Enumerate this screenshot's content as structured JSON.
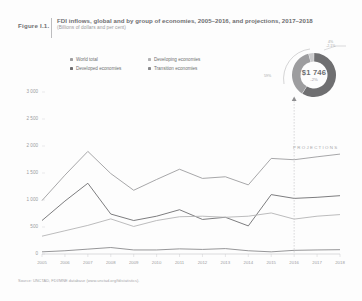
{
  "figure": {
    "label": "Figure I.1.",
    "title": "FDI inflows, global and by group of economies, 2005–2016, and projections, 2017–2018",
    "subtitle": "(Billions of dollars and per cent)"
  },
  "legend": {
    "items": [
      {
        "label": "World total",
        "color": "#9d9d9f"
      },
      {
        "label": "Developed economies",
        "color": "#6e6e70"
      },
      {
        "label": "Developing economies",
        "color": "#b4b4b6"
      },
      {
        "label": "Transition economies",
        "color": "#8a8a8c"
      }
    ]
  },
  "donut": {
    "center_value": "$1 746",
    "center_change": "-2%",
    "left_label": "59%",
    "top_label_line1": "4%",
    "top_label_line2": "-2.1%",
    "segments": [
      {
        "name": "developing",
        "percent": 59,
        "color": "#6f6f71"
      },
      {
        "name": "developed",
        "percent": 37,
        "color": "#9d9d9f"
      },
      {
        "name": "transition",
        "percent": 4,
        "color": "#c9c9cb"
      }
    ]
  },
  "projections": {
    "label": "PROJECTIONS",
    "divider_year": "2016"
  },
  "source": {
    "text": "Source: UNCTAD, FDI/MNE database (www.unctad.org/fdistatistics)."
  },
  "chart_data": {
    "type": "line",
    "title": "FDI inflows, global and by group of economies, 2005–2016, and projections, 2017–2018",
    "xlabel": "",
    "ylabel": "Billions of dollars",
    "ylim": [
      0,
      3000
    ],
    "yticks": [
      "0",
      "500",
      "1 000",
      "1 500",
      "2 000",
      "2 500",
      "3 000"
    ],
    "ytick_values": [
      0,
      500,
      1000,
      1500,
      2000,
      2500,
      3000
    ],
    "grid": false,
    "legend_position": "top",
    "categories": [
      "2005",
      "2006",
      "2007",
      "2008",
      "2009",
      "2010",
      "2011",
      "2012",
      "2013",
      "2014",
      "2015",
      "2016",
      "2017",
      "2018"
    ],
    "series": [
      {
        "name": "World total",
        "color": "#9d9d9f",
        "values": [
          990,
          1460,
          1900,
          1490,
          1180,
          1380,
          1570,
          1400,
          1430,
          1280,
          1770,
          1746,
          1800,
          1850
        ]
      },
      {
        "name": "Developed economies",
        "color": "#6e6e70",
        "values": [
          620,
          980,
          1310,
          740,
          620,
          700,
          820,
          640,
          680,
          520,
          1100,
          1030,
          1050,
          1080
        ]
      },
      {
        "name": "Developing economies",
        "color": "#b4b4b6",
        "values": [
          330,
          430,
          530,
          650,
          510,
          620,
          690,
          700,
          680,
          700,
          760,
          646,
          700,
          730
        ]
      },
      {
        "name": "Transition economies",
        "color": "#8a8a8c",
        "values": [
          40,
          60,
          90,
          120,
          75,
          75,
          95,
          85,
          100,
          60,
          40,
          68,
          75,
          80
        ]
      }
    ],
    "annotations": [
      {
        "text": "PROJECTIONS",
        "x": "2017"
      }
    ]
  }
}
